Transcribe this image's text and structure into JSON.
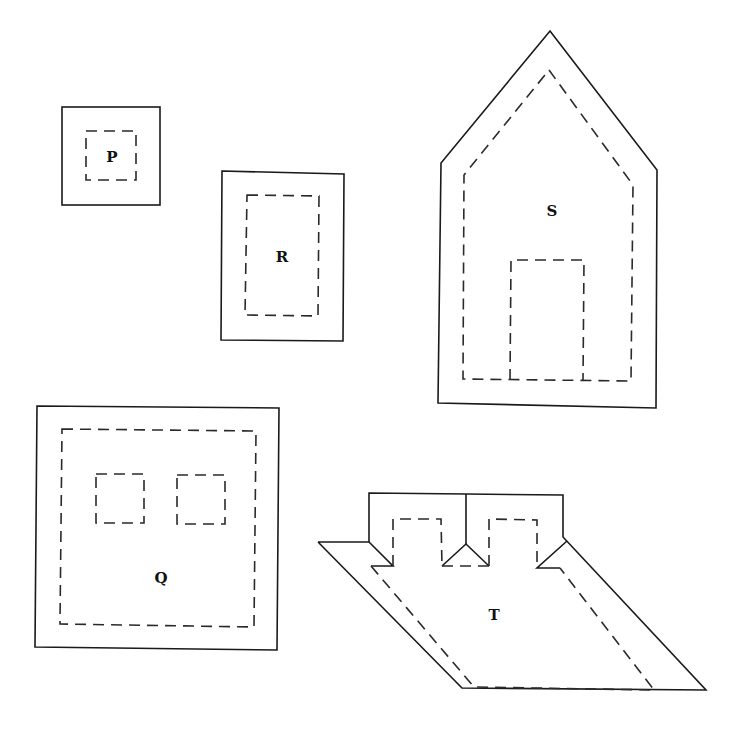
{
  "figure": {
    "colors": {
      "line": "#1a1a1a",
      "background": "#ffffff"
    },
    "shapes": [
      {
        "id": "P",
        "label": "P",
        "kind": "small square with inner dashed square"
      },
      {
        "id": "R",
        "label": "R",
        "kind": "rectangle with inner dashed rectangle"
      },
      {
        "id": "S",
        "label": "S",
        "kind": "house-shaped pentagon with dashed inner outline and dashed door"
      },
      {
        "id": "Q",
        "label": "Q",
        "kind": "large square with dashed inner square and two dashed windows"
      },
      {
        "id": "T",
        "label": "T",
        "kind": "parallelogram with two folding tabs on top"
      }
    ]
  }
}
